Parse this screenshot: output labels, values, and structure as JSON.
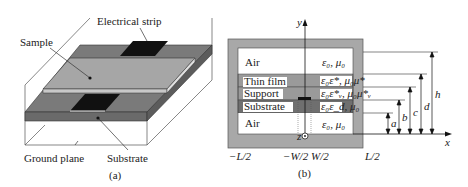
{
  "panel_a": {
    "caption": "(a)",
    "labels": {
      "electrical_strip": "Electrical strip",
      "sample": "Sample",
      "ground_plane": "Ground plane",
      "substrate": "Substrate"
    }
  },
  "panel_b": {
    "caption": "(b)",
    "axes": {
      "y": "y",
      "x": "x",
      "z": "z"
    },
    "layers": [
      {
        "name": "Air",
        "props": "ε₀, μ₀"
      },
      {
        "name": "Thin film",
        "props": "ε₀ε*, μ₀μ*"
      },
      {
        "name": "Support",
        "props": "ε₀ε*ᵥ, μ₀μ*ᵥ"
      },
      {
        "name": "Substrate",
        "props": "ε₀ε_d, μ₀"
      },
      {
        "name": "Air",
        "props": "ε₀, μ₀"
      }
    ],
    "heights": [
      "a",
      "b",
      "c",
      "d",
      "h"
    ],
    "x_ticks": [
      "−L/2",
      "−W/2",
      "W/2",
      "L/2"
    ]
  }
}
